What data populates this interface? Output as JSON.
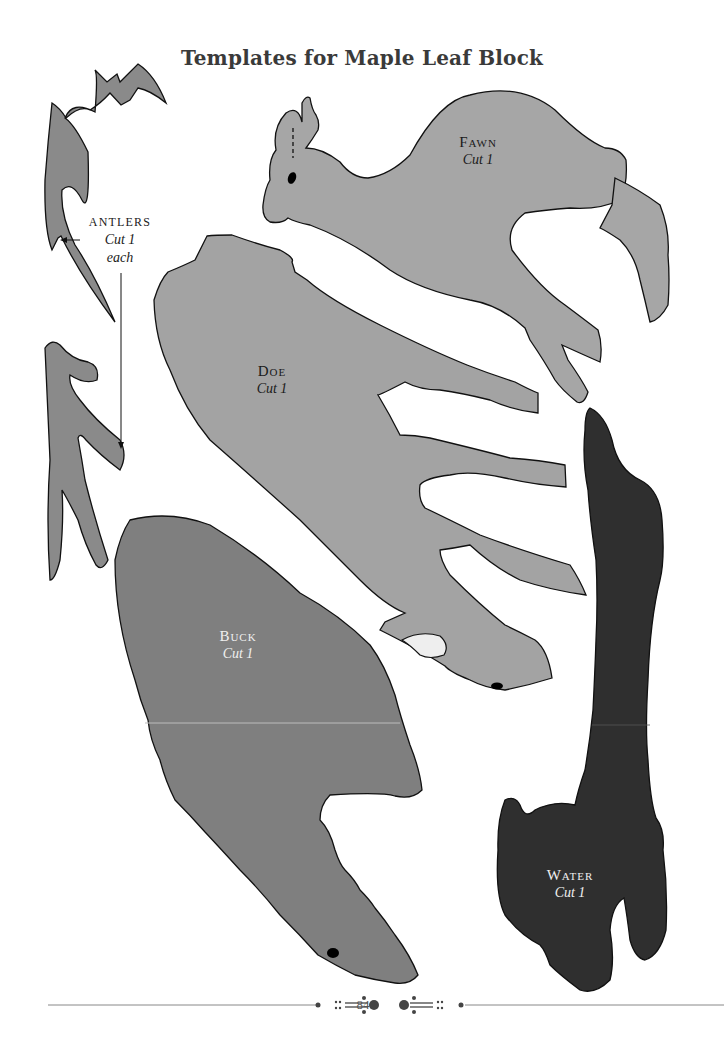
{
  "page": {
    "title": "Templates for Maple Leaf Block",
    "page_number": "84"
  },
  "templates": [
    {
      "name": "Antlers",
      "instruction": "Cut 1",
      "extra": "each",
      "fill": "#8a8a8a"
    },
    {
      "name": "Fawn",
      "instruction": "Cut 1",
      "fill": "#a6a6a6"
    },
    {
      "name": "Doe",
      "instruction": "Cut 1",
      "fill": "#a3a3a3"
    },
    {
      "name": "Buck",
      "instruction": "Cut 1",
      "fill": "#7f7f7f"
    },
    {
      "name": "Water",
      "instruction": "Cut 1",
      "fill": "#2f2f2f"
    }
  ],
  "colors": {
    "outline": "#111111",
    "title": "#3a3a3a",
    "rule": "#888888"
  }
}
